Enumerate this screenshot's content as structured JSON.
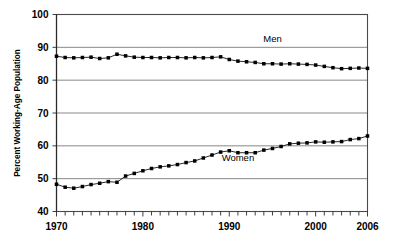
{
  "chart_data": {
    "type": "line",
    "title": "",
    "subtitle": "",
    "xlabel": "",
    "ylabel": "Percent Working-Age Population",
    "xlim": [
      1970,
      2006
    ],
    "ylim": [
      40,
      100
    ],
    "ytick_labels": [
      "40",
      "50",
      "60",
      "70",
      "80",
      "90",
      "100"
    ],
    "ytick_values": [
      40,
      50,
      60,
      70,
      80,
      90,
      100
    ],
    "xtick_labels": [
      "1970",
      "1980",
      "1990",
      "2000",
      "2006"
    ],
    "xtick_values": [
      1970,
      1980,
      1990,
      2000,
      2006
    ],
    "xtick_minor_step": 1,
    "grid": "horizontal",
    "legend_position": "inline-annotation",
    "marker": "filled-square",
    "x": [
      1970,
      1971,
      1972,
      1973,
      1974,
      1975,
      1976,
      1977,
      1978,
      1979,
      1980,
      1981,
      1982,
      1983,
      1984,
      1985,
      1986,
      1987,
      1988,
      1989,
      1990,
      1991,
      1992,
      1993,
      1994,
      1995,
      1996,
      1997,
      1998,
      1999,
      2000,
      2001,
      2002,
      2003,
      2004,
      2005,
      2006
    ],
    "series": [
      {
        "name": "Men",
        "label": "Men",
        "color": "#000000",
        "values": [
          87.3,
          86.9,
          86.8,
          86.9,
          87.0,
          86.6,
          86.8,
          87.9,
          87.4,
          87.0,
          86.9,
          86.9,
          86.8,
          86.9,
          86.9,
          86.8,
          86.9,
          86.8,
          86.9,
          87.1,
          86.3,
          85.8,
          85.6,
          85.4,
          85.0,
          85.0,
          84.9,
          85.0,
          84.9,
          84.8,
          84.6,
          84.2,
          83.8,
          83.5,
          83.6,
          83.7,
          83.6
        ]
      },
      {
        "name": "Women",
        "label": "Women",
        "color": "#000000",
        "values": [
          48.3,
          47.4,
          47.1,
          47.6,
          48.2,
          48.6,
          49.1,
          48.9,
          50.8,
          51.6,
          52.4,
          53.1,
          53.6,
          53.9,
          54.3,
          54.9,
          55.4,
          56.3,
          57.2,
          58.1,
          58.5,
          57.9,
          57.9,
          57.9,
          58.7,
          59.2,
          59.8,
          60.6,
          60.8,
          60.9,
          61.2,
          61.1,
          61.2,
          61.3,
          61.9,
          62.2,
          63.0
        ]
      }
    ],
    "annotations": [
      {
        "text": "Men",
        "x": 1995.0,
        "y": 91.6
      },
      {
        "text": "Women",
        "x": 1991.0,
        "y": 55.3
      }
    ]
  }
}
